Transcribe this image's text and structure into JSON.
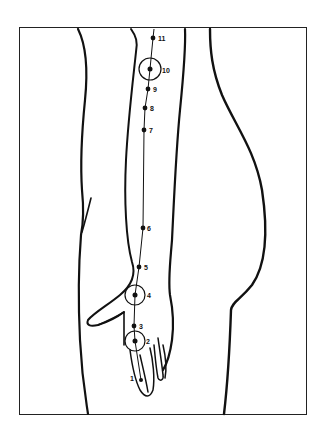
{
  "diagram": {
    "type": "anatomical meridian chart",
    "colors": {
      "ink": "#111111",
      "background": "#ffffff"
    },
    "points": [
      {
        "label": "1",
        "x": 141,
        "y": 380,
        "circled": false
      },
      {
        "label": "2",
        "x": 135,
        "y": 341,
        "circled": true
      },
      {
        "label": "3",
        "x": 134,
        "y": 326,
        "circled": false
      },
      {
        "label": "4",
        "x": 135,
        "y": 295,
        "circled": true
      },
      {
        "label": "5",
        "x": 139,
        "y": 267,
        "circled": false
      },
      {
        "label": "6",
        "x": 143,
        "y": 228,
        "circled": false
      },
      {
        "label": "7",
        "x": 144,
        "y": 130,
        "circled": false
      },
      {
        "label": "8",
        "x": 145,
        "y": 108,
        "circled": false
      },
      {
        "label": "9",
        "x": 148,
        "y": 89,
        "circled": false
      },
      {
        "label": "10",
        "x": 150,
        "y": 69,
        "circled": true
      },
      {
        "label": "11",
        "x": 153,
        "y": 38,
        "circled": false
      }
    ]
  }
}
